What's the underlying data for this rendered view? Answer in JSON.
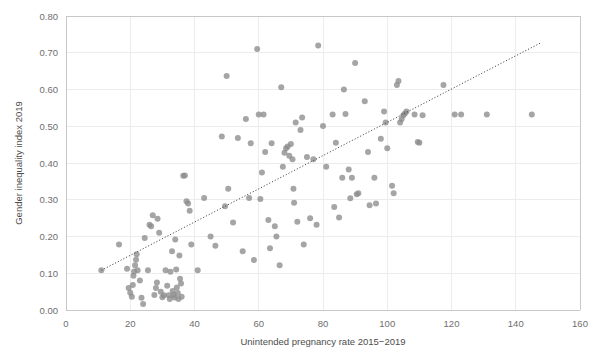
{
  "chart_data": {
    "type": "scatter",
    "title": "",
    "xlabel": "Unintended pregnancy rate 2015−2019",
    "ylabel": "Gender inequality index 2019",
    "xlim": [
      0,
      160
    ],
    "ylim": [
      0.0,
      0.8
    ],
    "xticks": [
      "0",
      "20",
      "40",
      "60",
      "80",
      "100",
      "120",
      "140",
      "160"
    ],
    "yticks": [
      "0.00",
      "0.10",
      "0.20",
      "0.30",
      "0.40",
      "0.50",
      "0.60",
      "0.70",
      "0.80"
    ],
    "grid": true,
    "legend": "none",
    "marker_color": "#8c8c8c",
    "trendline": {
      "style": "dotted",
      "color": "#3f3f3f",
      "x_start": 11.0,
      "y_start": 0.108,
      "x_end": 148.0,
      "y_end": 0.728
    },
    "points": [
      [
        11.0,
        0.108
      ],
      [
        16.5,
        0.178
      ],
      [
        19.0,
        0.112
      ],
      [
        19.5,
        0.06
      ],
      [
        20.0,
        0.047
      ],
      [
        20.5,
        0.036
      ],
      [
        20.8,
        0.068
      ],
      [
        21.0,
        0.093
      ],
      [
        21.2,
        0.105
      ],
      [
        21.5,
        0.122
      ],
      [
        21.8,
        0.137
      ],
      [
        22.0,
        0.152
      ],
      [
        22.3,
        0.108
      ],
      [
        23.0,
        0.08
      ],
      [
        23.5,
        0.033
      ],
      [
        24.0,
        0.016
      ],
      [
        24.5,
        0.196
      ],
      [
        25.5,
        0.108
      ],
      [
        26.0,
        0.232
      ],
      [
        26.5,
        0.228
      ],
      [
        27.0,
        0.258
      ],
      [
        27.5,
        0.041
      ],
      [
        28.0,
        0.06
      ],
      [
        28.3,
        0.075
      ],
      [
        28.5,
        0.248
      ],
      [
        29.0,
        0.21
      ],
      [
        29.5,
        0.05
      ],
      [
        30.0,
        0.035
      ],
      [
        30.5,
        0.04
      ],
      [
        31.0,
        0.108
      ],
      [
        31.5,
        0.066
      ],
      [
        32.0,
        0.04
      ],
      [
        32.3,
        0.03
      ],
      [
        32.5,
        0.104
      ],
      [
        33.0,
        0.16
      ],
      [
        33.2,
        0.052
      ],
      [
        33.5,
        0.041
      ],
      [
        33.8,
        0.034
      ],
      [
        34.0,
        0.192
      ],
      [
        34.3,
        0.11
      ],
      [
        34.5,
        0.061
      ],
      [
        34.8,
        0.046
      ],
      [
        35.0,
        0.03
      ],
      [
        35.3,
        0.148
      ],
      [
        35.5,
        0.085
      ],
      [
        35.8,
        0.072
      ],
      [
        36.0,
        0.036
      ],
      [
        36.5,
        0.365
      ],
      [
        37.0,
        0.366
      ],
      [
        37.5,
        0.296
      ],
      [
        38.0,
        0.29
      ],
      [
        38.5,
        0.27
      ],
      [
        39.0,
        0.178
      ],
      [
        41.0,
        0.108
      ],
      [
        43.0,
        0.305
      ],
      [
        45.0,
        0.2
      ],
      [
        46.5,
        0.175
      ],
      [
        48.5,
        0.472
      ],
      [
        49.5,
        0.282
      ],
      [
        50.0,
        0.637
      ],
      [
        50.5,
        0.33
      ],
      [
        52.0,
        0.238
      ],
      [
        53.5,
        0.468
      ],
      [
        55.0,
        0.16
      ],
      [
        56.0,
        0.52
      ],
      [
        57.0,
        0.305
      ],
      [
        57.5,
        0.454
      ],
      [
        58.5,
        0.136
      ],
      [
        59.5,
        0.71
      ],
      [
        60.0,
        0.532
      ],
      [
        60.5,
        0.302
      ],
      [
        61.0,
        0.374
      ],
      [
        61.5,
        0.532
      ],
      [
        62.0,
        0.43
      ],
      [
        63.0,
        0.245
      ],
      [
        63.5,
        0.168
      ],
      [
        64.0,
        0.454
      ],
      [
        65.0,
        0.228
      ],
      [
        65.5,
        0.2
      ],
      [
        66.5,
        0.122
      ],
      [
        67.0,
        0.606
      ],
      [
        67.5,
        0.39
      ],
      [
        68.0,
        0.428
      ],
      [
        68.5,
        0.44
      ],
      [
        69.0,
        0.445
      ],
      [
        69.5,
        0.42
      ],
      [
        70.0,
        0.452
      ],
      [
        70.5,
        0.41
      ],
      [
        70.8,
        0.33
      ],
      [
        71.0,
        0.292
      ],
      [
        71.5,
        0.51
      ],
      [
        72.0,
        0.24
      ],
      [
        73.0,
        0.49
      ],
      [
        73.5,
        0.524
      ],
      [
        74.0,
        0.178
      ],
      [
        75.0,
        0.416
      ],
      [
        76.0,
        0.25
      ],
      [
        77.0,
        0.41
      ],
      [
        78.0,
        0.232
      ],
      [
        78.5,
        0.72
      ],
      [
        80.0,
        0.501
      ],
      [
        81.0,
        0.39
      ],
      [
        83.0,
        0.532
      ],
      [
        83.5,
        0.28
      ],
      [
        84.0,
        0.455
      ],
      [
        85.0,
        0.252
      ],
      [
        86.0,
        0.36
      ],
      [
        86.5,
        0.6
      ],
      [
        87.0,
        0.533
      ],
      [
        88.0,
        0.382
      ],
      [
        88.5,
        0.304
      ],
      [
        89.0,
        0.36
      ],
      [
        90.0,
        0.672
      ],
      [
        90.5,
        0.315
      ],
      [
        91.0,
        0.318
      ],
      [
        93.0,
        0.568
      ],
      [
        94.0,
        0.43
      ],
      [
        94.5,
        0.285
      ],
      [
        96.0,
        0.36
      ],
      [
        96.5,
        0.29
      ],
      [
        98.0,
        0.466
      ],
      [
        99.0,
        0.54
      ],
      [
        99.5,
        0.51
      ],
      [
        100.0,
        0.44
      ],
      [
        101.5,
        0.338
      ],
      [
        102.0,
        0.318
      ],
      [
        103.0,
        0.612
      ],
      [
        103.5,
        0.623
      ],
      [
        104.0,
        0.51
      ],
      [
        104.5,
        0.52
      ],
      [
        105.0,
        0.53
      ],
      [
        105.5,
        0.535
      ],
      [
        106.0,
        0.54
      ],
      [
        108.5,
        0.532
      ],
      [
        109.5,
        0.457
      ],
      [
        110.0,
        0.455
      ],
      [
        111.0,
        0.53
      ],
      [
        117.5,
        0.612
      ],
      [
        121.0,
        0.532
      ],
      [
        123.0,
        0.532
      ],
      [
        131.0,
        0.532
      ],
      [
        145.0,
        0.532
      ]
    ]
  }
}
